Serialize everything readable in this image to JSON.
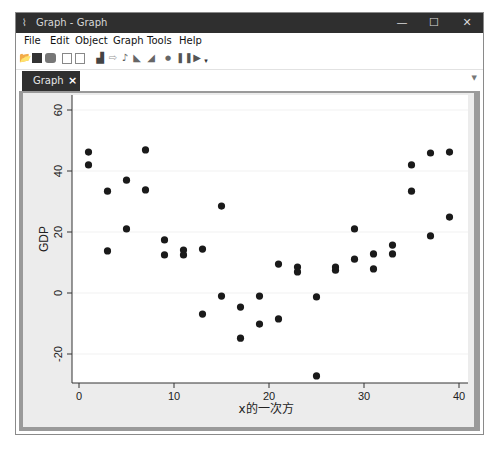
{
  "window": {
    "title": "Graph - Graph",
    "controls": {
      "minimize": "—",
      "maximize": "☐",
      "close": "✕"
    }
  },
  "menu": {
    "items": [
      "File",
      "Edit",
      "Object",
      "Graph",
      "Tools",
      "Help"
    ]
  },
  "toolbar": {
    "icons": [
      "open-icon",
      "save-icon",
      "print-icon",
      "copy-icon",
      "paste-icon",
      "graph-editor-icon",
      "select-icon",
      "add-text-icon",
      "add-line-icon",
      "add-marker-icon",
      "record-icon",
      "pause-icon",
      "play-icon"
    ]
  },
  "tabs": [
    {
      "label": "Graph",
      "close": "×"
    }
  ],
  "chart_data": {
    "type": "scatter",
    "title": "",
    "xlabel": "x的一次方",
    "ylabel": "GDP",
    "xlim": [
      -0.5,
      41
    ],
    "ylim": [
      -29,
      62
    ],
    "xticks": [
      0,
      10,
      20,
      30,
      40
    ],
    "yticks": [
      -20,
      0,
      20,
      40,
      60
    ],
    "grid": true,
    "marker_color": "#1a1a1a",
    "points": [
      {
        "x": 1,
        "y": 46.2
      },
      {
        "x": 1,
        "y": 42.0
      },
      {
        "x": 3,
        "y": 33.4
      },
      {
        "x": 3,
        "y": 13.8
      },
      {
        "x": 5,
        "y": 37.0
      },
      {
        "x": 5,
        "y": 21.0
      },
      {
        "x": 7,
        "y": 46.9
      },
      {
        "x": 7,
        "y": 33.8
      },
      {
        "x": 9,
        "y": 17.4
      },
      {
        "x": 9,
        "y": 12.5
      },
      {
        "x": 11,
        "y": 14.1
      },
      {
        "x": 11,
        "y": 12.5
      },
      {
        "x": 13,
        "y": 14.4
      },
      {
        "x": 13,
        "y": -6.9
      },
      {
        "x": 15,
        "y": 28.5
      },
      {
        "x": 15,
        "y": -1.0
      },
      {
        "x": 17,
        "y": -4.6
      },
      {
        "x": 17,
        "y": -14.8
      },
      {
        "x": 19,
        "y": -1.0
      },
      {
        "x": 19,
        "y": -10.2
      },
      {
        "x": 21,
        "y": 9.5
      },
      {
        "x": 21,
        "y": -8.5
      },
      {
        "x": 23,
        "y": 8.5
      },
      {
        "x": 23,
        "y": 6.9
      },
      {
        "x": 25,
        "y": -1.3
      },
      {
        "x": 25,
        "y": -27.2
      },
      {
        "x": 27,
        "y": 8.5
      },
      {
        "x": 27,
        "y": 7.5
      },
      {
        "x": 29,
        "y": 21.0
      },
      {
        "x": 29,
        "y": 11.1
      },
      {
        "x": 31,
        "y": 12.8
      },
      {
        "x": 31,
        "y": 7.9
      },
      {
        "x": 33,
        "y": 15.7
      },
      {
        "x": 33,
        "y": 12.8
      },
      {
        "x": 35,
        "y": 42.0
      },
      {
        "x": 35,
        "y": 33.4
      },
      {
        "x": 37,
        "y": 45.9
      },
      {
        "x": 37,
        "y": 18.7
      },
      {
        "x": 39,
        "y": 46.2
      },
      {
        "x": 39,
        "y": 24.9
      }
    ]
  }
}
